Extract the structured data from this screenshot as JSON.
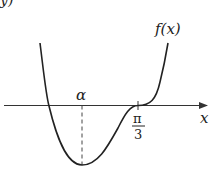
{
  "figure": {
    "corner_fragment": "y)",
    "function_label": "f(x)",
    "axis_label": "x",
    "critical_point_label": "α",
    "inflection_label_numerator": "π",
    "inflection_label_denominator": "3"
  }
}
